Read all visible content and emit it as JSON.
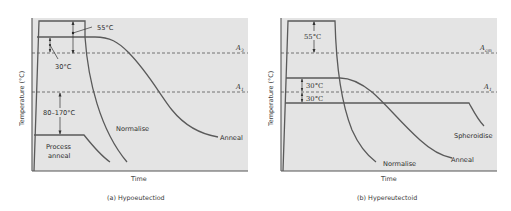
{
  "panels": [
    {
      "id": "a",
      "caption": "(a) Hypoeutectiod",
      "xlabel": "Time",
      "ylabel": "Temperature (°C)",
      "lines": {
        "upper": "A3",
        "lower": "A1"
      },
      "annotations": {
        "top_gap": "55°C",
        "plateau_gap": "30°C",
        "process_gap": "80–170°C",
        "process_label_1": "Process",
        "process_label_2": "anneal"
      },
      "curves": {
        "normalise": "Normalise",
        "anneal": "Anneal"
      }
    },
    {
      "id": "b",
      "caption": "(b) Hypereutectoid",
      "xlabel": "Time",
      "ylabel": "Temperature (°C)",
      "lines": {
        "upper": "Acm",
        "lower": "A1"
      },
      "annotations": {
        "top_gap": "55°C",
        "above_a1_gap": "30°C",
        "below_a1_gap": "30°C"
      },
      "curves": {
        "normalise": "Normalise",
        "anneal": "Anneal",
        "spheroidise": "Spheroidise"
      }
    }
  ],
  "colors": {
    "plot_bg": "#e4e4e4",
    "line": "#5a5a5a",
    "text": "#2e2e2e"
  }
}
